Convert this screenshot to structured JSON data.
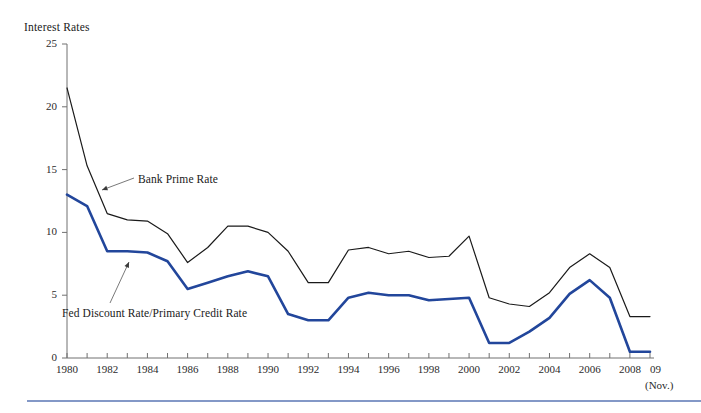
{
  "chart_data": {
    "type": "line",
    "title": "Interest Rates",
    "xlabel": "",
    "ylabel": "Interest Rates",
    "ylim": [
      0,
      25
    ],
    "yticks": [
      0,
      5,
      10,
      15,
      20,
      25
    ],
    "xlim": [
      1980,
      2009
    ],
    "xticks": [
      1980,
      1982,
      1984,
      1986,
      1988,
      1990,
      1992,
      1994,
      1996,
      1998,
      2000,
      2002,
      2004,
      2006,
      2008
    ],
    "xtick_labels": [
      "1980",
      "1982",
      "1984",
      "1986",
      "1988",
      "1990",
      "1992",
      "1994",
      "1996",
      "1998",
      "2000",
      "2002",
      "2004",
      "2006",
      "2008"
    ],
    "x_end_label": "09",
    "x_end_note": "(Nov.)",
    "grid": false,
    "legend_position": "inline-annotation",
    "x": [
      1980,
      1981,
      1982,
      1983,
      1984,
      1985,
      1986,
      1987,
      1988,
      1989,
      1990,
      1991,
      1992,
      1993,
      1994,
      1995,
      1996,
      1997,
      1998,
      1999,
      2000,
      2001,
      2002,
      2003,
      2004,
      2005,
      2006,
      2007,
      2008,
      2009
    ],
    "series": [
      {
        "name": "Bank Prime Rate",
        "color": "#1a1a1a",
        "width": 1.2,
        "values": [
          21.5,
          15.3,
          11.5,
          11.0,
          10.9,
          9.9,
          7.6,
          8.8,
          10.5,
          10.5,
          10.0,
          8.5,
          6.0,
          6.0,
          8.6,
          8.8,
          8.3,
          8.5,
          8.0,
          8.1,
          9.7,
          4.8,
          4.3,
          4.1,
          5.2,
          7.2,
          8.3,
          7.2,
          3.3,
          3.3
        ]
      },
      {
        "name": "Fed Discount Rate/Primary Credit Rate",
        "color": "#22469b",
        "width": 2.6,
        "values": [
          13.0,
          12.1,
          8.5,
          8.5,
          8.4,
          7.7,
          5.5,
          6.0,
          6.5,
          6.9,
          6.5,
          3.5,
          3.0,
          3.0,
          4.8,
          5.2,
          5.0,
          5.0,
          4.6,
          4.7,
          4.8,
          1.2,
          1.2,
          2.1,
          3.2,
          5.1,
          6.2,
          4.8,
          0.5,
          0.5
        ]
      }
    ],
    "annotations": [
      {
        "label": "Bank Prime Rate",
        "text_x": 138,
        "text_y": 173,
        "leader_from_x": 134,
        "leader_from_y": 178,
        "leader_to_x": 102,
        "leader_to_y": 190
      },
      {
        "label": "Fed Discount Rate/Primary Credit Rate",
        "text_x": 62,
        "text_y": 307,
        "leader_from_x": 110,
        "leader_from_y": 303,
        "leader_to_x": 129,
        "leader_to_y": 262
      }
    ],
    "colors": {
      "bank_prime_rate": "#1a1a1a",
      "fed_discount_rate": "#22469b",
      "axis": "#707070",
      "divider": "#3e5fa8",
      "background": "#ffffff"
    }
  },
  "footer": {
    "divider_visible": true
  }
}
